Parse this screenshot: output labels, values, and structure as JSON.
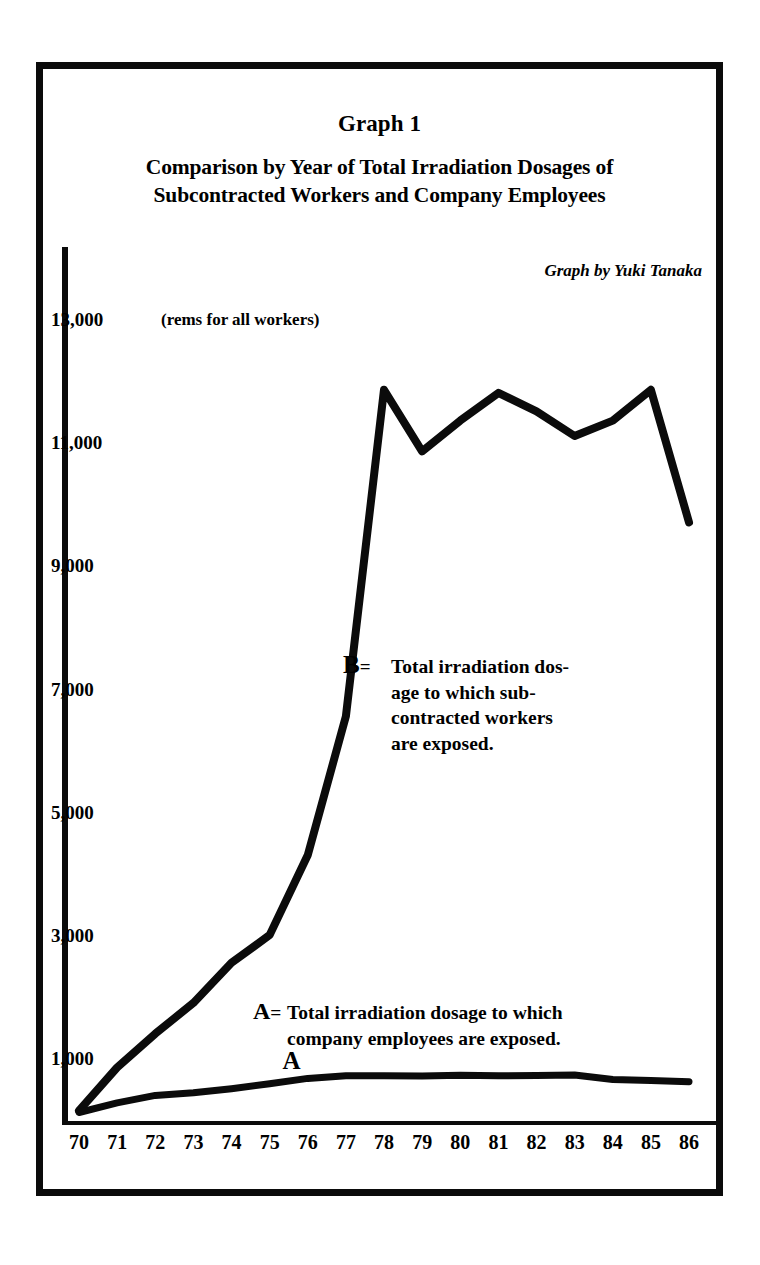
{
  "figure": {
    "graph_number": "Graph 1",
    "title_line1": "Comparison by Year of Total Irradiation Dosages of",
    "title_line2": "Subcontracted Workers and Company Employees",
    "attribution": "Graph by Yuki Tanaka",
    "axis_unit_note": "(rems for all workers)",
    "ink_color": "#0b0b0b",
    "background_color": "#ffffff"
  },
  "legend": {
    "series_b": {
      "key": "B",
      "equals": "=",
      "text": "Total irradiation dosage to which subcontracted workers are exposed.",
      "line1": "Total irradiation dos-",
      "line2": "age to which sub-",
      "line3": "contracted workers",
      "line4": "are exposed."
    },
    "series_a": {
      "key": "A",
      "equals": "=",
      "text": "Total irradiation dosage to which company employees are exposed.",
      "line1": "Total irradiation dosage to which",
      "line2": "company employees are exposed."
    },
    "marker_a": "A",
    "marker_b": "B"
  },
  "chart_data": {
    "type": "line",
    "title": "Comparison by Year of Total Irradiation Dosages of Subcontracted Workers and Company Employees",
    "subtitle": "Graph 1",
    "annotation": "Graph by Yuki Tanaka",
    "xlabel": "",
    "ylabel": "(rems for all workers)",
    "grid": false,
    "legend_position": "inline-annotations",
    "xlim": [
      70,
      86
    ],
    "ylim": [
      0,
      13000
    ],
    "x": [
      70,
      71,
      72,
      73,
      74,
      75,
      76,
      77,
      78,
      79,
      80,
      81,
      82,
      83,
      84,
      85,
      86
    ],
    "xtick_labels": [
      "70",
      "71",
      "72",
      "73",
      "74",
      "75",
      "76",
      "77",
      "78",
      "79",
      "80",
      "81",
      "82",
      "83",
      "84",
      "85",
      "86"
    ],
    "ytick_values": [
      1000,
      3000,
      5000,
      7000,
      9000,
      11000,
      13000
    ],
    "ytick_labels": [
      "1,000",
      "3,000",
      "5,000",
      "7,000",
      "9,000",
      "11,000",
      "13,000"
    ],
    "series": [
      {
        "name": "B",
        "label": "Total irradiation dosage to which subcontracted workers are exposed.",
        "values": [
          200,
          900,
          1450,
          1950,
          2600,
          3050,
          4350,
          6600,
          11900,
          10900,
          11400,
          11850,
          11550,
          11150,
          11400,
          11900,
          9750
        ]
      },
      {
        "name": "A",
        "label": "Total irradiation dosage to which company employees are exposed.",
        "values": [
          170,
          340,
          430,
          500,
          560,
          620,
          740,
          760,
          760,
          780,
          760,
          770,
          780,
          760,
          720,
          690,
          670
        ]
      }
    ],
    "notes": [
      "Series B peaks at approximately 12,300 rems just after 1978 and again near 11,900 around 1981 and 1985.",
      "Series B falls sharply to roughly 9,750 rems at 1986.",
      "Series A remains low and nearly flat, under 1,000 rems for all years."
    ]
  }
}
